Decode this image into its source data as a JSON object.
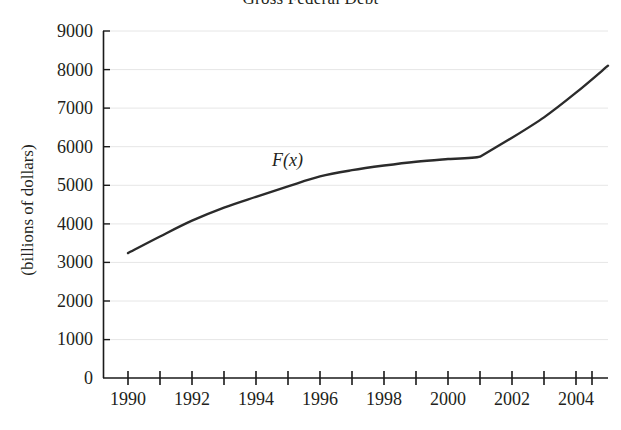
{
  "chart_data": {
    "type": "line",
    "title": "Gross Federal Debt",
    "xlabel": "",
    "ylabel": "(billions of dollars)",
    "series_label": "F(x)",
    "xlim": [
      1989.5,
      2005.3
    ],
    "ylim": [
      0,
      9000
    ],
    "grid": true,
    "legend_position": "inline-annotation",
    "x_tick_labels": [
      "1990",
      "1992",
      "1994",
      "1996",
      "1998",
      "2000",
      "2002",
      "2004"
    ],
    "x_tick_values": [
      1990,
      1992,
      1994,
      1996,
      1998,
      2000,
      2002,
      2004
    ],
    "x_minor_tick_values": [
      1991,
      1993,
      1995,
      1997,
      1999,
      2001,
      2003,
      2005
    ],
    "y_tick_labels": [
      "0",
      "1000",
      "2000",
      "3000",
      "4000",
      "5000",
      "6000",
      "7000",
      "8000",
      "9000"
    ],
    "y_tick_values": [
      0,
      1000,
      2000,
      3000,
      4000,
      5000,
      6000,
      7000,
      8000,
      9000
    ],
    "x": [
      1990,
      1991,
      1992,
      1993,
      1994,
      1995,
      1996,
      1997,
      1998,
      1999,
      2000,
      2001,
      2002,
      2003,
      2004,
      2005
    ],
    "values": [
      3240,
      3670,
      4080,
      4420,
      4700,
      4970,
      5230,
      5390,
      5510,
      5610,
      5680,
      5740,
      6230,
      6760,
      7400,
      8100
    ],
    "line_color": "#2b2b2b",
    "grid_color": "#e8e8e8",
    "axis_color": "#1a1a1a"
  }
}
